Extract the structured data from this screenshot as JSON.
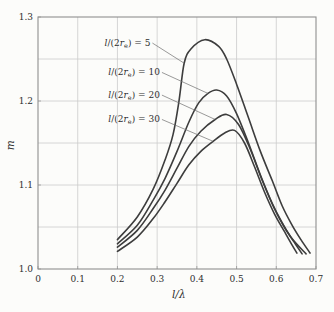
{
  "figure": {
    "background": "#fcfcfa",
    "frame_color": "#8f8f8f",
    "grid_color": "#cbcbcb",
    "curve_color": "#3d3d3d",
    "leader_color": "#6e6e6e",
    "text_color": "#2e2e2e"
  },
  "chart_data": {
    "type": "line",
    "title": "",
    "xlabel": "l/λ",
    "ylabel": "m",
    "xlim": [
      0,
      0.7
    ],
    "ylim": [
      1.0,
      1.3
    ],
    "x_ticks": [
      0,
      0.1,
      0.2,
      0.3,
      0.4,
      0.5,
      0.6,
      0.7
    ],
    "x_tick_labels": [
      "0",
      "0.1",
      "0.2",
      "0.3",
      "0.4",
      "0.5",
      "0.6",
      "0.7"
    ],
    "y_ticks": [
      1.0,
      1.1,
      1.2,
      1.3
    ],
    "y_tick_labels": [
      "1.0",
      "1.1",
      "1.2",
      "1.3"
    ],
    "grid": {
      "on": true,
      "x_step": 0.1,
      "y_step": 0.05
    },
    "legend_position": "inline-labels",
    "series": [
      {
        "name": "l/(2r_e) = 5",
        "label_parts": {
          "lead": "l",
          "open": "/(2",
          "var": "r",
          "sub": "e",
          "close": ") = ",
          "value": "5"
        },
        "label_anchor": [
          0.283,
          1.269
        ],
        "attach_point": [
          0.368,
          1.245
        ],
        "peak": [
          0.42,
          1.273
        ],
        "points": [
          [
            0.2,
            1.035
          ],
          [
            0.25,
            1.062
          ],
          [
            0.29,
            1.095
          ],
          [
            0.32,
            1.13
          ],
          [
            0.34,
            1.16
          ],
          [
            0.355,
            1.2
          ],
          [
            0.368,
            1.245
          ],
          [
            0.385,
            1.262
          ],
          [
            0.42,
            1.273
          ],
          [
            0.455,
            1.265
          ],
          [
            0.475,
            1.25
          ],
          [
            0.5,
            1.22
          ],
          [
            0.53,
            1.18
          ],
          [
            0.56,
            1.14
          ],
          [
            0.59,
            1.105
          ],
          [
            0.615,
            1.075
          ],
          [
            0.64,
            1.052
          ],
          [
            0.662,
            1.035
          ],
          [
            0.685,
            1.019
          ]
        ]
      },
      {
        "name": "l/(2r_e) = 10",
        "label_parts": {
          "lead": "l",
          "open": "/(2",
          "var": "r",
          "sub": "e",
          "close": ") = ",
          "value": "10"
        },
        "label_anchor": [
          0.307,
          1.234
        ],
        "attach_point": [
          0.428,
          1.209
        ],
        "peak": [
          0.45,
          1.213
        ],
        "points": [
          [
            0.2,
            1.03
          ],
          [
            0.25,
            1.052
          ],
          [
            0.29,
            1.082
          ],
          [
            0.32,
            1.108
          ],
          [
            0.35,
            1.14
          ],
          [
            0.38,
            1.175
          ],
          [
            0.405,
            1.198
          ],
          [
            0.428,
            1.209
          ],
          [
            0.45,
            1.213
          ],
          [
            0.475,
            1.206
          ],
          [
            0.5,
            1.185
          ],
          [
            0.53,
            1.15
          ],
          [
            0.56,
            1.112
          ],
          [
            0.59,
            1.078
          ],
          [
            0.615,
            1.055
          ],
          [
            0.64,
            1.036
          ],
          [
            0.675,
            1.018
          ]
        ]
      },
      {
        "name": "l/(2r_e) = 20",
        "label_parts": {
          "lead": "l",
          "open": "/(2",
          "var": "r",
          "sub": "e",
          "close": ") = ",
          "value": "20"
        },
        "label_anchor": [
          0.307,
          1.207
        ],
        "attach_point": [
          0.446,
          1.178
        ],
        "peak": [
          0.475,
          1.184
        ],
        "points": [
          [
            0.2,
            1.026
          ],
          [
            0.25,
            1.046
          ],
          [
            0.29,
            1.072
          ],
          [
            0.32,
            1.094
          ],
          [
            0.35,
            1.12
          ],
          [
            0.38,
            1.146
          ],
          [
            0.41,
            1.164
          ],
          [
            0.446,
            1.178
          ],
          [
            0.475,
            1.184
          ],
          [
            0.505,
            1.172
          ],
          [
            0.535,
            1.142
          ],
          [
            0.565,
            1.105
          ],
          [
            0.595,
            1.072
          ],
          [
            0.62,
            1.05
          ],
          [
            0.645,
            1.032
          ],
          [
            0.665,
            1.018
          ]
        ]
      },
      {
        "name": "l/(2r_e) = 30",
        "label_parts": {
          "lead": "l",
          "open": "/(2",
          "var": "r",
          "sub": "e",
          "close": ") = ",
          "value": "30"
        },
        "label_anchor": [
          0.307,
          1.178
        ],
        "attach_point": [
          0.441,
          1.152
        ],
        "peak": [
          0.495,
          1.165
        ],
        "points": [
          [
            0.2,
            1.021
          ],
          [
            0.25,
            1.038
          ],
          [
            0.29,
            1.06
          ],
          [
            0.32,
            1.08
          ],
          [
            0.35,
            1.102
          ],
          [
            0.38,
            1.124
          ],
          [
            0.41,
            1.14
          ],
          [
            0.441,
            1.152
          ],
          [
            0.47,
            1.162
          ],
          [
            0.495,
            1.165
          ],
          [
            0.52,
            1.15
          ],
          [
            0.545,
            1.122
          ],
          [
            0.57,
            1.092
          ],
          [
            0.595,
            1.066
          ],
          [
            0.62,
            1.045
          ],
          [
            0.638,
            1.03
          ],
          [
            0.652,
            1.019
          ]
        ]
      }
    ]
  }
}
